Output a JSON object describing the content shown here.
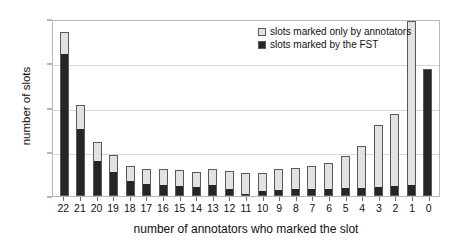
{
  "chart_data": {
    "type": "bar",
    "title": "",
    "xlabel": "number of annotators who marked the slot",
    "ylabel": "number of slots",
    "stacked": true,
    "grid": true,
    "legend_position": "top-right",
    "ylim": [
      0,
      400
    ],
    "yticks": [
      0,
      100,
      200,
      300,
      400
    ],
    "categories": [
      "22",
      "21",
      "20",
      "19",
      "18",
      "17",
      "16",
      "15",
      "14",
      "13",
      "12",
      "11",
      "10",
      "9",
      "8",
      "7",
      "6",
      "5",
      "4",
      "3",
      "2",
      "1",
      "0"
    ],
    "series": [
      {
        "name": "slots marked by the FST",
        "color": "#262626",
        "values": [
          323,
          152,
          81,
          55,
          35,
          27,
          25,
          22,
          19,
          24,
          16,
          2,
          10,
          13,
          14,
          14,
          15,
          16,
          17,
          19,
          20,
          22,
          287
        ]
      },
      {
        "name": "slots marked only by annotators",
        "color": "#e2e2e2",
        "values": [
          47,
          53,
          41,
          38,
          32,
          35,
          37,
          36,
          35,
          38,
          40,
          50,
          42,
          49,
          50,
          53,
          60,
          74,
          96,
          141,
          166,
          373,
          0
        ]
      }
    ],
    "totals": [
      370,
      205,
      122,
      93,
      67,
      62,
      62,
      58,
      54,
      62,
      56,
      52,
      52,
      62,
      64,
      67,
      75,
      90,
      113,
      160,
      186,
      395,
      287
    ]
  },
  "legend": {
    "items": [
      {
        "label": "slots marked only by annotators",
        "color": "#e2e2e2"
      },
      {
        "label": "slots marked by the FST",
        "color": "#262626"
      }
    ]
  }
}
